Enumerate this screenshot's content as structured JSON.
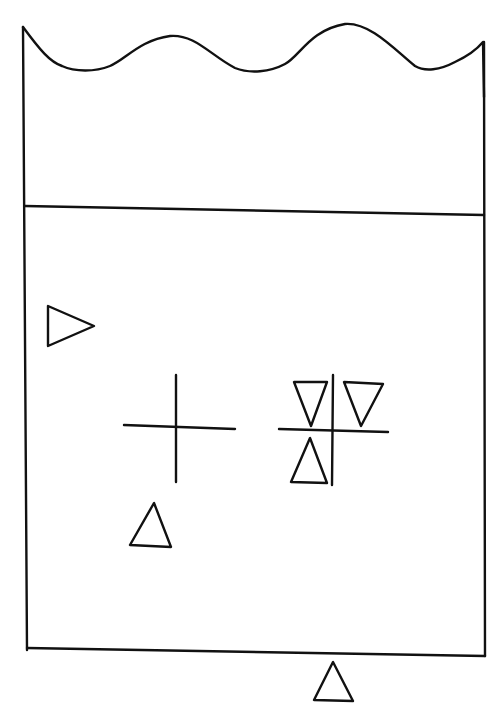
{
  "diagram": {
    "stroke_color": "#111111",
    "background_color": "#ffffff",
    "elements": [
      {
        "id": "container",
        "type": "outline",
        "shape": "rectangle-with-wavy-top"
      },
      {
        "id": "level-line",
        "type": "line",
        "orientation": "horizontal"
      },
      {
        "id": "marker-left",
        "type": "triangle",
        "direction": "right"
      },
      {
        "id": "cross-left",
        "type": "cross"
      },
      {
        "id": "marker-lower-left",
        "type": "triangle",
        "direction": "up"
      },
      {
        "id": "cross-right",
        "type": "cross",
        "quadrant_markers": [
          {
            "quadrant": "upper-left",
            "type": "triangle",
            "direction": "down"
          },
          {
            "quadrant": "upper-right",
            "type": "triangle",
            "direction": "down"
          },
          {
            "quadrant": "lower-left",
            "type": "triangle",
            "direction": "up"
          }
        ]
      },
      {
        "id": "marker-bottom",
        "type": "triangle",
        "direction": "up",
        "position": "below-container"
      }
    ]
  }
}
